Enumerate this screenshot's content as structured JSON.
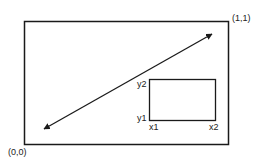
{
  "diagram": {
    "title": "",
    "outer_rect": {
      "corner_labels": {
        "top_right": "(1,1)",
        "bottom_left": "(0,0)"
      }
    },
    "diagonal_arrow": {
      "type": "double-headed",
      "from": "lower-left",
      "to": "upper-right"
    },
    "inner_rect": {
      "labels": {
        "y_top": "y2",
        "y_bottom": "y1",
        "x_left": "x1",
        "x_right": "x2"
      }
    },
    "colors": {
      "stroke": "#1a1a1a",
      "background": "#ffffff",
      "text": "#222222"
    }
  }
}
